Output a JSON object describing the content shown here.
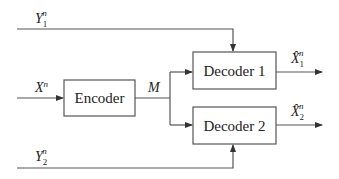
{
  "diagram": {
    "type": "block-diagram",
    "blocks": {
      "encoder": "Encoder",
      "decoder1": "Decoder 1",
      "decoder2": "Decoder 2"
    },
    "signals": {
      "y1": {
        "base": "Y",
        "sub": "1",
        "sup": "n"
      },
      "x": {
        "base": "X",
        "sup": "n"
      },
      "m": {
        "base": "M"
      },
      "y2": {
        "base": "Y",
        "sub": "2",
        "sup": "n"
      },
      "xhat1": {
        "base": "X̂",
        "sub": "1",
        "sup": "n"
      },
      "xhat2": {
        "base": "X̂",
        "sub": "2",
        "sup": "n"
      }
    },
    "colors": {
      "line": "#555555",
      "box_border": "#555555",
      "text": "#222222"
    }
  }
}
